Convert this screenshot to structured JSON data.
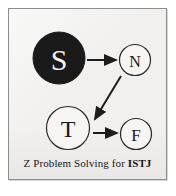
{
  "figure": {
    "title": "Z Problem Solving for ISTJ",
    "background_color": "#f1f0ef",
    "frame_color": "#8e8d8c",
    "ink_color": "#1a1a1a"
  },
  "nodes": [
    {
      "id": "sensing",
      "label": "S",
      "name": "Sensing",
      "order": 1,
      "style": "filled",
      "fill": "#1a1a1a",
      "text_color": "#f7f6f5",
      "cx": 50,
      "cy": 49,
      "r": 26
    },
    {
      "id": "intuition",
      "label": "N",
      "name": "Intuition",
      "order": 2,
      "style": "outline",
      "fill": "#f6f5f4",
      "text_color": "#1a1a1a",
      "cx": 126,
      "cy": 51,
      "r": 16
    },
    {
      "id": "thinking",
      "label": "T",
      "name": "Thinking",
      "order": 3,
      "style": "outline",
      "fill": "#f6f5f4",
      "text_color": "#1a1a1a",
      "cx": 59,
      "cy": 119,
      "r": 22
    },
    {
      "id": "feeling",
      "label": "F",
      "name": "Feeling",
      "order": 4,
      "style": "outline",
      "fill": "#f6f5f4",
      "text_color": "#1a1a1a",
      "cx": 127,
      "cy": 125,
      "r": 16
    }
  ],
  "edges": [
    {
      "id": "s-to-n",
      "from": "sensing",
      "to": "intuition",
      "kind": "horizontal-arrow",
      "x1": 78,
      "y1": 51,
      "x2": 108,
      "y2": 51
    },
    {
      "id": "n-to-t",
      "from": "intuition",
      "to": "thinking",
      "kind": "diagonal-arrow",
      "x1": 112,
      "y1": 68,
      "x2": 85,
      "y2": 112
    },
    {
      "id": "t-to-f",
      "from": "thinking",
      "to": "feeling",
      "kind": "horizontal-arrow",
      "x1": 84,
      "y1": 124,
      "x2": 109,
      "y2": 124
    }
  ],
  "caption": {
    "lead": "Z Problem Solving for ",
    "type_code": "ISTJ",
    "full": "Z Problem Solving for ISTJ"
  }
}
